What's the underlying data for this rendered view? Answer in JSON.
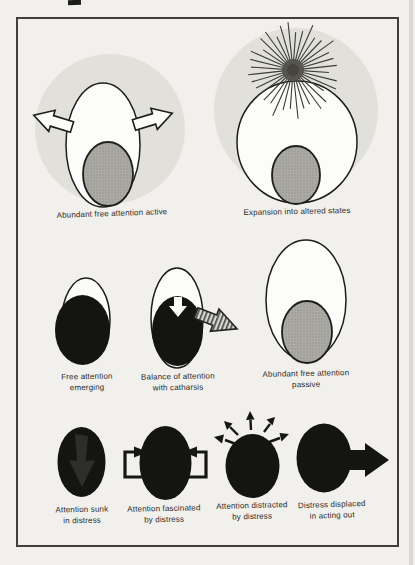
{
  "colors": {
    "paper": "#f1f0ec",
    "frame_border": "#403f3c",
    "halo_gray": "#e1e0db",
    "screen_gray": "#abaaa4",
    "distress_black": "#141413",
    "white_fill": "#fcfcfa",
    "caption_text": "#2b2b2b"
  },
  "figures": {
    "abundant_active": {
      "caption": "Abundant free attention active"
    },
    "expansion_altered": {
      "caption": "Expansion into altered states"
    },
    "free_emerging": {
      "line1": "Free attention",
      "line2": "emerging"
    },
    "balance_catharsis": {
      "line1": "Balance of attention",
      "line2": "with catharsis"
    },
    "abundant_passive": {
      "line1": "Abundant free attention",
      "line2": "passive"
    },
    "attention_sunk": {
      "line1": "Attention sunk",
      "line2": "in distress"
    },
    "attention_fascinated": {
      "line1": "Attention fascinated",
      "line2": "by distress"
    },
    "attention_distracted": {
      "line1": "Attention distracted",
      "line2": "by distress"
    },
    "distress_displaced": {
      "line1": "Distress displaced",
      "line2": "in acting out"
    }
  }
}
